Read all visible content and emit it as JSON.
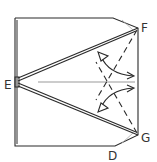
{
  "diagram": {
    "type": "origami-fold-instruction",
    "labels": {
      "E": "E",
      "F": "F",
      "G": "G",
      "D": "D"
    },
    "colors": {
      "line": "#2a2a2a",
      "guide": "#999999",
      "background": "#ffffff"
    }
  }
}
